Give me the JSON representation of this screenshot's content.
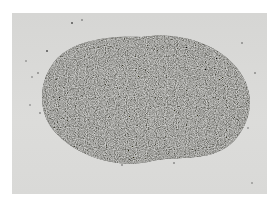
{
  "image": {
    "subject": "pile of granular gravel/sand on light background",
    "colors": {
      "background": "#d8d8d6",
      "pile_dark": "#3f3f3d",
      "pile_mid": "#6e6e6a",
      "pile_light": "#9a9a95",
      "frame": "#ffffff"
    }
  }
}
